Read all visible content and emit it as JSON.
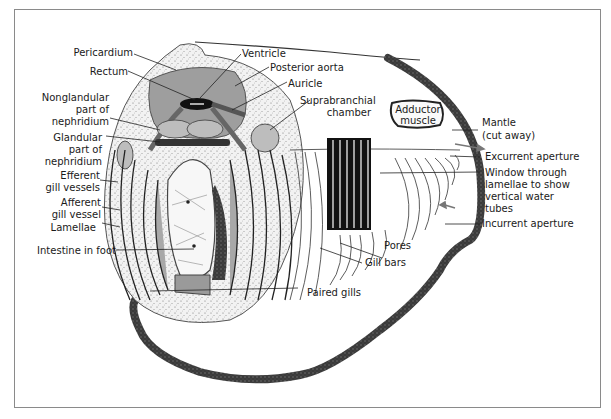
{
  "diagram": {
    "labels": {
      "pericardium": "Pericardium",
      "rectum": "Rectum",
      "ventricle": "Ventricle",
      "posterior_aorta": "Posterior aorta",
      "auricle": "Auricle",
      "suprabranchial_chamber_1": "Suprabranchial",
      "suprabranchial_chamber_2": "chamber",
      "nonglandular_1": "Nonglandular",
      "nonglandular_2": "part of",
      "nonglandular_3": "nephridium",
      "glandular_1": "Glandular",
      "glandular_2": "part of",
      "glandular_3": "nephridium",
      "efferent_1": "Efferent",
      "efferent_2": "gill vessels",
      "afferent_1": "Afferent",
      "afferent_2": "gill vessel",
      "lamellae": "Lamellae",
      "intestine_in_foot": "Intestine in foot",
      "adductor_1": "Adductor",
      "adductor_2": "muscle",
      "mantle_1": "Mantle",
      "mantle_2": "(cut away)",
      "excurrent_aperture": "Excurrent aperture",
      "window_1": "Window through",
      "window_2": "lamellae to show",
      "window_3": "vertical water",
      "window_4": "tubes",
      "incurrent_aperture": "Incurrent aperture",
      "pores": "Pores",
      "gill_bars": "Gill bars",
      "paired_gills": "Paired gills"
    },
    "colors": {
      "frame": "#8a8a8a",
      "mantle_edge": "#3a3a3a",
      "pericardium_fill": "#9a9a9a",
      "stipple_fill": "#e6e6e6",
      "window_fill": "#111111",
      "gill_fill": "#a8a8a8",
      "leader_line": "#222222"
    }
  }
}
